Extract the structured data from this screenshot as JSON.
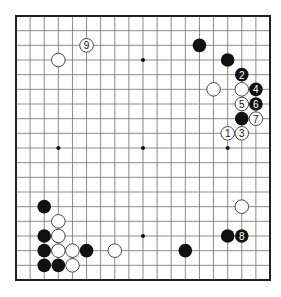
{
  "diagram": {
    "type": "go-board",
    "size": 19,
    "colors": {
      "background": "#ffffff",
      "grid": "#6e6e6e",
      "border": "#222222",
      "black_stone": "#111111",
      "white_stone": "#ffffff",
      "white_stone_edge": "#333333",
      "star_point": "#111111"
    },
    "star_points": [
      [
        3,
        3
      ],
      [
        9,
        3
      ],
      [
        15,
        3
      ],
      [
        3,
        9
      ],
      [
        9,
        9
      ],
      [
        15,
        9
      ],
      [
        3,
        15
      ],
      [
        9,
        15
      ],
      [
        15,
        15
      ]
    ],
    "stones": [
      {
        "color": "white",
        "col": 3,
        "row": 3,
        "label": ""
      },
      {
        "color": "white",
        "col": 5,
        "row": 2,
        "label": "9"
      },
      {
        "color": "black",
        "col": 13,
        "row": 2,
        "label": ""
      },
      {
        "color": "black",
        "col": 15,
        "row": 3,
        "label": ""
      },
      {
        "color": "black",
        "col": 16,
        "row": 4,
        "label": "2"
      },
      {
        "color": "white",
        "col": 14,
        "row": 5,
        "label": ""
      },
      {
        "color": "white",
        "col": 16,
        "row": 5,
        "label": ""
      },
      {
        "color": "black",
        "col": 17,
        "row": 5,
        "label": "4"
      },
      {
        "color": "white",
        "col": 16,
        "row": 6,
        "label": "5"
      },
      {
        "color": "black",
        "col": 17,
        "row": 6,
        "label": "6"
      },
      {
        "color": "black",
        "col": 16,
        "row": 7,
        "label": ""
      },
      {
        "color": "white",
        "col": 17,
        "row": 7,
        "label": "7"
      },
      {
        "color": "white",
        "col": 15,
        "row": 8,
        "label": "1"
      },
      {
        "color": "white",
        "col": 16,
        "row": 8,
        "label": "3"
      },
      {
        "color": "black",
        "col": 2,
        "row": 13,
        "label": ""
      },
      {
        "color": "white",
        "col": 3,
        "row": 14,
        "label": ""
      },
      {
        "color": "black",
        "col": 2,
        "row": 15,
        "label": ""
      },
      {
        "color": "white",
        "col": 3,
        "row": 15,
        "label": ""
      },
      {
        "color": "black",
        "col": 2,
        "row": 16,
        "label": ""
      },
      {
        "color": "white",
        "col": 3,
        "row": 16,
        "label": ""
      },
      {
        "color": "white",
        "col": 4,
        "row": 16,
        "label": ""
      },
      {
        "color": "black",
        "col": 5,
        "row": 16,
        "label": ""
      },
      {
        "color": "white",
        "col": 7,
        "row": 16,
        "label": ""
      },
      {
        "color": "black",
        "col": 2,
        "row": 17,
        "label": ""
      },
      {
        "color": "black",
        "col": 3,
        "row": 17,
        "label": ""
      },
      {
        "color": "white",
        "col": 4,
        "row": 17,
        "label": ""
      },
      {
        "color": "white",
        "col": 16,
        "row": 13,
        "label": ""
      },
      {
        "color": "black",
        "col": 15,
        "row": 15,
        "label": ""
      },
      {
        "color": "black",
        "col": 16,
        "row": 15,
        "label": "8"
      },
      {
        "color": "black",
        "col": 12,
        "row": 16,
        "label": ""
      }
    ]
  }
}
